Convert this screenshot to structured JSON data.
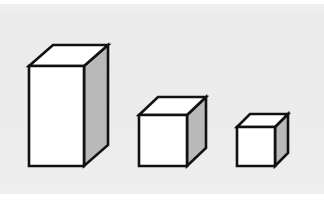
{
  "figure": {
    "background_color": "#ffffff",
    "panel_color": "#ededee",
    "panel": {
      "x": 0,
      "y": 4,
      "width": 324,
      "height": 190
    },
    "canvas": {
      "width": 324,
      "height": 207
    },
    "style": {
      "stroke_color": "#111111",
      "front_face_color": "#ffffff",
      "top_face_color": "#ffffff",
      "side_face_color": "#b9b9b9",
      "stroke_width": 2.6,
      "baseline_y": 166
    },
    "shapes": [
      {
        "name": "tall-box",
        "label": "Tall box",
        "kind": "rectangular-prism",
        "order": 1,
        "front_face": {
          "left": 29,
          "right": 84,
          "top": 66,
          "bottom": 166
        },
        "depth_offset": {
          "dx": 24,
          "dy": -21
        },
        "faces": {
          "front": "29,66 84,66 84,166 29,166",
          "top": "29,66 53,45 108,45 84,66",
          "right": "84,66 108,45 108,145 84,166"
        }
      },
      {
        "name": "medium-cube",
        "label": "Medium cube",
        "kind": "cube",
        "order": 2,
        "front_face": {
          "left": 139,
          "right": 187,
          "top": 115,
          "bottom": 166
        },
        "depth_offset": {
          "dx": 19,
          "dy": -18
        },
        "faces": {
          "front": "139,115 187,115 187,166 139,166",
          "top": "139,115 158,97 206,97 187,115",
          "right": "187,115 206,97 206,148 187,166"
        }
      },
      {
        "name": "small-cube",
        "label": "Small cube",
        "kind": "cube",
        "order": 3,
        "front_face": {
          "left": 237,
          "right": 275,
          "top": 127,
          "bottom": 166
        },
        "depth_offset": {
          "dx": 13,
          "dy": -13
        },
        "faces": {
          "front": "237,127 275,127 275,166 237,166",
          "top": "237,127 250,114 288,114 275,127",
          "right": "275,127 288,114 288,153 275,166"
        }
      }
    ]
  }
}
